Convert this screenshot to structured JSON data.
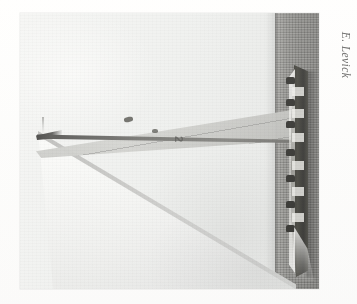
{
  "plate": {
    "kind": "photographic-plate",
    "orientation": "rotated-90-clockwise",
    "background_color": "#ffffff",
    "alt": "Black and white photograph of a large racing sailing yacht under full sail, printed sideways on the page"
  },
  "photograph": {
    "title": "",
    "subject": "racing yacht under full sail",
    "tone": "black-and-white",
    "sky_color": "#eceeed",
    "water_color": "#6a6a67",
    "hull_color": "#15150f",
    "mainsail_color": "#cfd0cd",
    "genoa_color": "#f4f5f4",
    "sail_marking": "2",
    "elements": {
      "sky_label": "sky",
      "water_label": "sea",
      "horizon_label": "horizon",
      "mainsail_label": "mainsail",
      "genoa_label": "headsail",
      "hull_label": "hull",
      "wake_label": "bow wake",
      "masthead_label": "masthead"
    },
    "crew_positions": [
      64,
      86,
      108,
      136,
      162,
      188,
      212
    ],
    "deck_highlight_positions": [
      74,
      96,
      120,
      148,
      174,
      200
    ]
  },
  "credit": {
    "photographer": "E. Levick",
    "color": "#3b3b3b"
  }
}
